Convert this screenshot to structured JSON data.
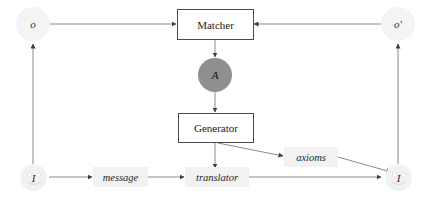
{
  "diagram": {
    "type": "flow-diagram",
    "canvas": {
      "width": 430,
      "height": 201,
      "background": "#ffffff"
    },
    "colors": {
      "stroke": "#7a7a7a",
      "box_border": "#4a4a4a",
      "text": "#1a1a1a",
      "circle_a_fill": "#8f8f8f",
      "faint_circle_fill": "#f4f4f4",
      "label_bg": "#f2f2f2"
    },
    "nodes": {
      "observation_left": {
        "label": "o",
        "shape": "circle",
        "style": "faint"
      },
      "observation_right": {
        "label": "o′",
        "shape": "circle",
        "style": "faint"
      },
      "matcher": {
        "label": "Matcher",
        "shape": "box"
      },
      "agent": {
        "label": "A",
        "shape": "circle",
        "style": "filled-gray"
      },
      "generator": {
        "label": "Generator",
        "shape": "box"
      },
      "human_left": {
        "label": "I",
        "shape": "smiley-circle",
        "style": "faint"
      },
      "human_right": {
        "label": "I",
        "shape": "smiley-circle",
        "style": "faint"
      }
    },
    "edge_labels": {
      "message": "message",
      "translator": "translator",
      "axioms": "axioms"
    },
    "edges": [
      {
        "from": "observation_left",
        "to": "matcher",
        "direction": "right"
      },
      {
        "from": "observation_right",
        "to": "matcher",
        "direction": "left"
      },
      {
        "from": "matcher",
        "to": "agent",
        "direction": "down"
      },
      {
        "from": "agent",
        "to": "generator",
        "direction": "down"
      },
      {
        "from": "generator",
        "to": "translator",
        "direction": "down"
      },
      {
        "from": "generator",
        "to": "axioms",
        "direction": "down-right"
      },
      {
        "from": "axioms",
        "to": "human_right",
        "direction": "down-right"
      },
      {
        "from": "human_left",
        "to": "message",
        "direction": "right"
      },
      {
        "from": "message",
        "to": "translator",
        "direction": "right"
      },
      {
        "from": "translator",
        "to": "human_right",
        "direction": "right"
      },
      {
        "from": "human_left",
        "to": "observation_left",
        "direction": "up"
      },
      {
        "from": "human_right",
        "to": "observation_right",
        "direction": "up"
      }
    ]
  }
}
